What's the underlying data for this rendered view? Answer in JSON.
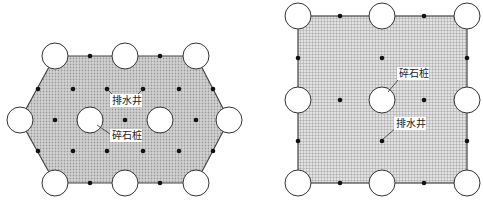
{
  "figures": [
    {
      "name": "hexagonal-layout",
      "labels": {
        "drain_well": "排水井",
        "gravel_pile": "碎石桩"
      }
    },
    {
      "name": "square-layout",
      "labels": {
        "gravel_pile": "碎石桩",
        "drain_well": "排水井"
      }
    }
  ],
  "colors": {
    "fill_hex": "#c8c8c8",
    "fill_square": "#cfcfcf",
    "outline": "#444444",
    "dot": "#111111",
    "pile": "#ffffff"
  }
}
